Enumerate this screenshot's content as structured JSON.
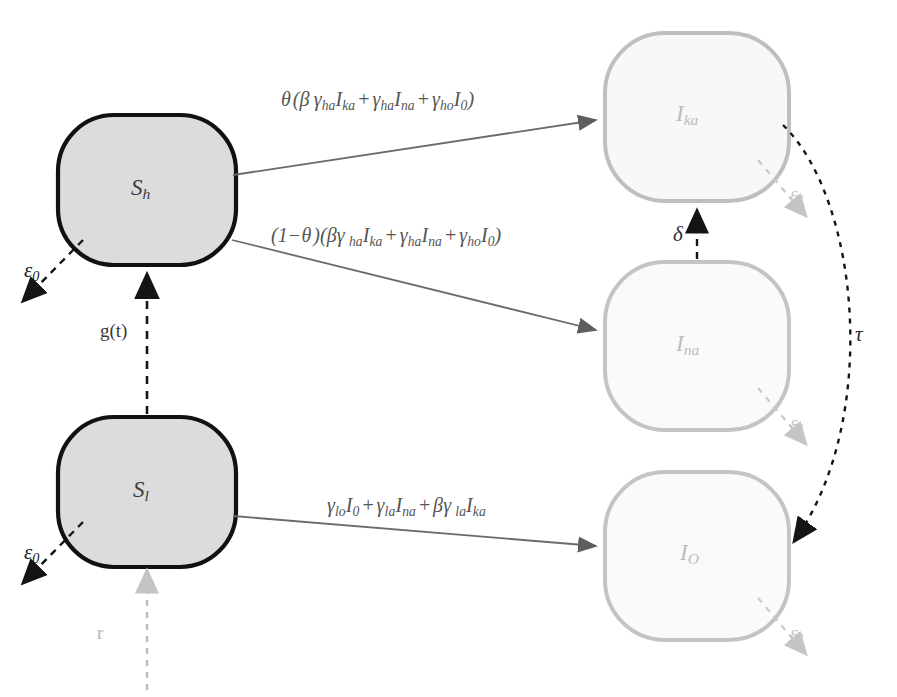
{
  "diagram": {
    "type": "compartment-flow",
    "colors": {
      "susceptible_border": "#111111",
      "susceptible_fill": "#dcdcdc",
      "infected_border": "#bfbfbf",
      "infected_fill": "#f7f7f7",
      "solid_arrow": "#6b6b6b",
      "dashed_arrow_dark": "#1a1a1a",
      "dashed_arrow_light": "#bdbdbd",
      "text_dark": "#3b3b3b",
      "text_light": "#bdbdbd",
      "background": "#ffffff"
    },
    "nodes": [
      {
        "id": "Sh",
        "label": "S",
        "sub": "h",
        "style": "susceptible",
        "cx": 147,
        "cy": 190,
        "rx": 90,
        "ry": 78
      },
      {
        "id": "Sl",
        "label": "S",
        "sub": "l",
        "style": "susceptible",
        "cx": 147,
        "cy": 492,
        "rx": 90,
        "ry": 78
      },
      {
        "id": "Ika",
        "label": "I",
        "sub": "ka",
        "style": "infected",
        "cx": 697,
        "cy": 117,
        "rx": 92,
        "ry": 84
      },
      {
        "id": "Ina",
        "label": "I",
        "sub": "na",
        "style": "infected",
        "cx": 697,
        "cy": 346,
        "rx": 92,
        "ry": 84
      },
      {
        "id": "Io",
        "label": "I",
        "sub": "O",
        "style": "infected",
        "cx": 697,
        "cy": 556,
        "rx": 92,
        "ry": 84
      }
    ],
    "edges": [
      {
        "id": "sh-to-ika",
        "from": "Sh",
        "to": "Ika",
        "style": "solid",
        "label_parts": [
          {
            "t": "θ",
            "k": "greek"
          },
          {
            "t": "(",
            "k": "paren"
          },
          {
            "t": "β",
            "k": "greek"
          },
          {
            "t": "γ",
            "k": "greek"
          },
          {
            "t": "ha",
            "k": "sub"
          },
          {
            "t": "I",
            "k": "var"
          },
          {
            "t": "ka",
            "k": "sub"
          },
          {
            "t": "+",
            "k": "op"
          },
          {
            "t": "γ",
            "k": "greek"
          },
          {
            "t": "ha",
            "k": "sub"
          },
          {
            "t": "I",
            "k": "var"
          },
          {
            "t": "na",
            "k": "sub"
          },
          {
            "t": "+",
            "k": "op"
          },
          {
            "t": "γ",
            "k": "greek"
          },
          {
            "t": "ho",
            "k": "sub"
          },
          {
            "t": "I",
            "k": "var"
          },
          {
            "t": "0",
            "k": "sub"
          },
          {
            "t": ")",
            "k": "paren"
          }
        ],
        "label_plain": "θ (β γha Ika + γha Ina + γho I0)"
      },
      {
        "id": "sh-to-ina",
        "from": "Sh",
        "to": "Ina",
        "style": "solid",
        "label_plain": "(1 − θ)(βγha Ika + γha Ina + γho I0)"
      },
      {
        "id": "sl-to-io",
        "from": "Sl",
        "to": "Io",
        "style": "solid",
        "label_plain": "γlo I0 + γla Ina + βγla Ika"
      },
      {
        "id": "sl-to-sh",
        "from": "Sl",
        "to": "Sh",
        "style": "dashed-dark",
        "label": "g(t)"
      },
      {
        "id": "ina-to-ika",
        "from": "Ina",
        "to": "Ika",
        "style": "dashed-dark",
        "label": "δ"
      },
      {
        "id": "ika-to-io",
        "from": "Ika",
        "to": "Io",
        "style": "dashed-dark-curve",
        "label": "τ"
      },
      {
        "id": "sh-exit",
        "from": "Sh",
        "to": "out",
        "style": "dashed-dark",
        "label": "ε",
        "sub": "0"
      },
      {
        "id": "sl-exit",
        "from": "Sl",
        "to": "out",
        "style": "dashed-dark",
        "label": "ε",
        "sub": "0"
      },
      {
        "id": "ika-exit",
        "from": "Ika",
        "to": "out",
        "style": "dashed-light",
        "label": "ε",
        "sub": "1"
      },
      {
        "id": "ina-exit",
        "from": "Ina",
        "to": "out",
        "style": "dashed-light",
        "label": "ε",
        "sub": "1"
      },
      {
        "id": "io-exit",
        "from": "Io",
        "to": "out",
        "style": "dashed-light",
        "label": "ε",
        "sub": "1"
      },
      {
        "id": "sl-birth",
        "from": "in",
        "to": "Sl",
        "style": "dashed-light",
        "label": "r"
      }
    ],
    "labels": {
      "eq_top": "θ (β γha Ika + γha Ina + γho I0)",
      "eq_mid": "(1−θ)(βγha Ika + γha Ina + γho I0)",
      "eq_bottom": "γlo I0 + γla Ina + βγla Ika",
      "gt": "g(t)",
      "delta": "δ",
      "tau": "τ",
      "r": "r",
      "eps0_a": "ε",
      "eps0_a_sub": "0",
      "eps0_b": "ε",
      "eps0_b_sub": "0",
      "eps1_a": "ε",
      "eps1_a_sub": "1",
      "eps1_b": "ε",
      "eps1_b_sub": "1",
      "eps1_c": "ε",
      "eps1_c_sub": "1",
      "node_sh": "S",
      "node_sh_sub": "h",
      "node_sl": "S",
      "node_sl_sub": "l",
      "node_ika": "I",
      "node_ika_sub": "ka",
      "node_ina": "I",
      "node_ina_sub": "na",
      "node_io": "I",
      "node_io_sub": "O",
      "theta": "θ",
      "beta": "β",
      "gamma": "γ",
      "one_minus": "(1−",
      "close_paren": ")",
      "open_paren": "(",
      "plus": "+"
    }
  }
}
